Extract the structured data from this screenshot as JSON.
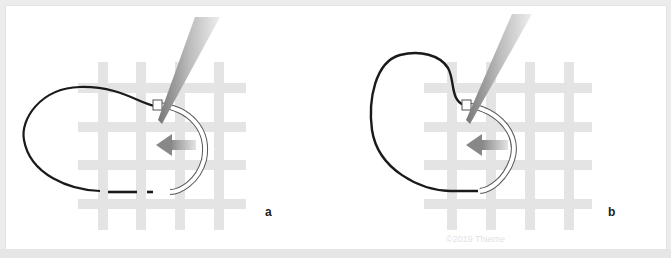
{
  "figure": {
    "panels": [
      {
        "id": "a",
        "label": "a",
        "description": "Curved suture needle held by forceps passing through a grid, arrow pointing left, suture loop with dashed end"
      },
      {
        "id": "b",
        "label": "b",
        "description": "Curved needle advanced through grid, arrow pointing left, suture loop pulled"
      }
    ],
    "watermark": "©2019 Thieme",
    "colors": {
      "grid": "#e3e3e3",
      "suture": "#1a1a1a",
      "arrow": "#8a8a8a",
      "forceps": "#9a9a9a",
      "background": "#ffffff"
    }
  }
}
